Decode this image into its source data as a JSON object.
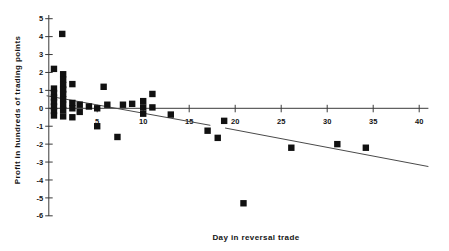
{
  "figure": {
    "background": "#ffffff",
    "text_color": "#141414",
    "axis_color": "#3a3a3a",
    "marker_color": "#111111",
    "trend_color": "#4a4a4a"
  },
  "chart_data": {
    "type": "scatter",
    "title": "",
    "xlabel": "Day in reversal trade",
    "ylabel": "Profit in hundreds of trading points",
    "xlim": [
      0,
      41.5
    ],
    "ylim": [
      -6,
      5
    ],
    "x_ticks": [
      5,
      10,
      15,
      20,
      25,
      30,
      35,
      40
    ],
    "y_ticks": [
      5,
      4,
      3,
      2,
      1,
      0,
      -1,
      -2,
      -3,
      -4,
      -5,
      -6
    ],
    "grid": false,
    "legend": "none",
    "marker": "filled-square",
    "points": [
      [
        0.3,
        2.2
      ],
      [
        0.3,
        1.1
      ],
      [
        0.3,
        0.85
      ],
      [
        0.3,
        0.6
      ],
      [
        0.3,
        0.35
      ],
      [
        0.3,
        0.1
      ],
      [
        0.3,
        -0.15
      ],
      [
        0.3,
        -0.4
      ],
      [
        1.2,
        4.15
      ],
      [
        1.3,
        1.9
      ],
      [
        1.3,
        1.6
      ],
      [
        1.3,
        1.3
      ],
      [
        1.3,
        1.05
      ],
      [
        1.3,
        0.8
      ],
      [
        1.3,
        0.5
      ],
      [
        1.3,
        0.2
      ],
      [
        1.3,
        -0.1
      ],
      [
        1.3,
        -0.45
      ],
      [
        2.3,
        1.35
      ],
      [
        2.3,
        0.3
      ],
      [
        2.3,
        0.0
      ],
      [
        2.3,
        -0.5
      ],
      [
        3.1,
        0.2
      ],
      [
        3.1,
        -0.2
      ],
      [
        4.1,
        0.1
      ],
      [
        5.0,
        0.0
      ],
      [
        5.0,
        -1.0
      ],
      [
        5.7,
        1.2
      ],
      [
        6.1,
        0.2
      ],
      [
        7.2,
        -1.6
      ],
      [
        7.8,
        0.2
      ],
      [
        8.8,
        0.25
      ],
      [
        10.0,
        0.4
      ],
      [
        10.0,
        0.05
      ],
      [
        10.0,
        -0.3
      ],
      [
        11.0,
        0.8
      ],
      [
        11.0,
        0.05
      ],
      [
        13.0,
        -0.35
      ],
      [
        17.0,
        -1.25
      ],
      [
        18.1,
        -1.65
      ],
      [
        18.8,
        -0.7
      ],
      [
        20.9,
        -5.3
      ],
      [
        26.1,
        -2.2
      ],
      [
        31.1,
        -2.0
      ],
      [
        34.2,
        -2.2
      ]
    ],
    "trendline": {
      "description": "downward-sloping regression line crossing zero near day 7",
      "segments": [
        {
          "x1": -0.5,
          "y1": 0.7,
          "x2": 17.3,
          "y2": -0.95
        },
        {
          "x1": 18.9,
          "y1": -1.1,
          "x2": 41.0,
          "y2": -3.25
        }
      ]
    }
  }
}
